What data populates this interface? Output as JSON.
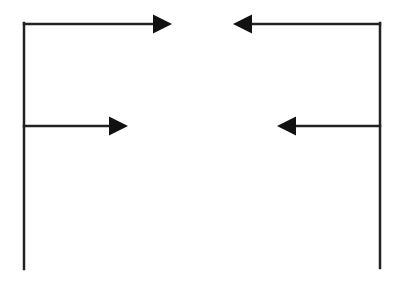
{
  "diagram": {
    "width": 398,
    "height": 284,
    "background": "#ffffff",
    "stroke_color": "#222222",
    "stroke_width": 2.5,
    "arrowhead": {
      "length": 19,
      "half_width": 9.5
    },
    "vertical_lines": [
      {
        "id": "left-spine",
        "x": 24,
        "y1": 23,
        "y2": 269
      },
      {
        "id": "right-spine",
        "x": 380,
        "y1": 23,
        "y2": 268
      }
    ],
    "arrows": [
      {
        "id": "top-left-arrow",
        "from": [
          24,
          24
        ],
        "to": [
          172,
          24
        ],
        "direction": "right"
      },
      {
        "id": "top-right-arrow",
        "from": [
          380,
          24
        ],
        "to": [
          233,
          24
        ],
        "direction": "left"
      },
      {
        "id": "middle-left-arrow",
        "from": [
          24,
          126
        ],
        "to": [
          128,
          126
        ],
        "direction": "right"
      },
      {
        "id": "middle-right-arrow",
        "from": [
          380,
          126
        ],
        "to": [
          277,
          126
        ],
        "direction": "left"
      }
    ]
  }
}
